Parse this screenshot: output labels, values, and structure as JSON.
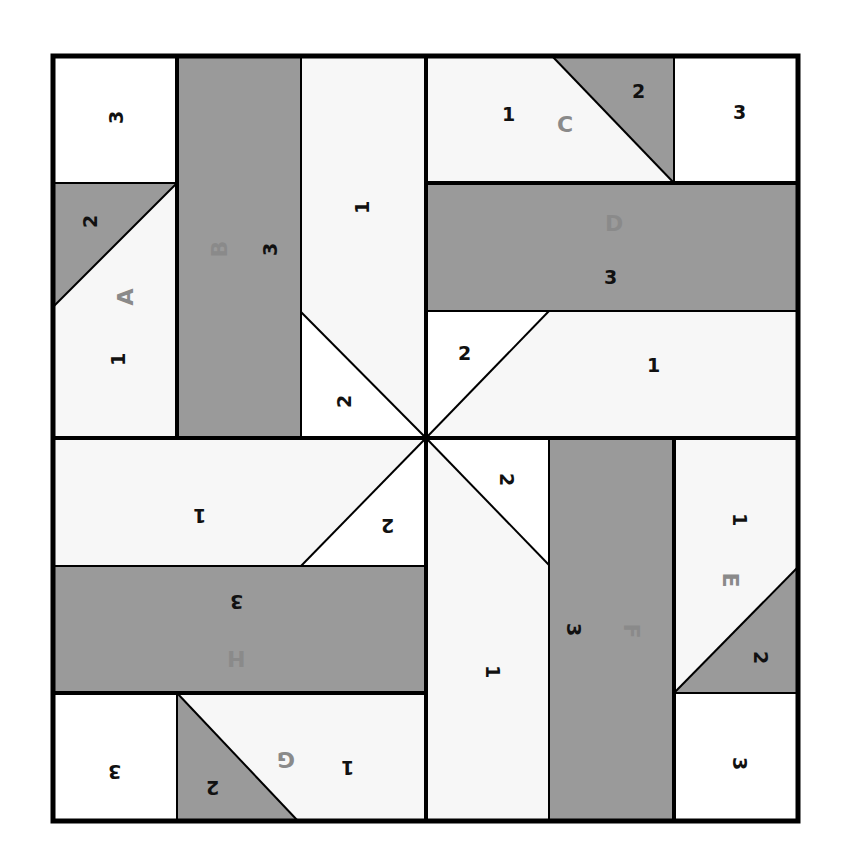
{
  "diagram": {
    "type": "quilt-block-foundation-piecing",
    "colors": {
      "dark": "#9a9a9a",
      "light": "#f7f7f7",
      "white": "#ffffff",
      "line": "#000000",
      "letter": "#8a8a8a",
      "number": "#111111"
    },
    "sections": [
      {
        "letter": "A",
        "pieces": [
          "1",
          "2",
          "3"
        ]
      },
      {
        "letter": "B",
        "pieces": [
          "1",
          "2",
          "3"
        ]
      },
      {
        "letter": "C",
        "pieces": [
          "1",
          "2",
          "3"
        ]
      },
      {
        "letter": "D",
        "pieces": [
          "1",
          "2",
          "3"
        ]
      },
      {
        "letter": "E",
        "pieces": [
          "1",
          "2",
          "3"
        ]
      },
      {
        "letter": "F",
        "pieces": [
          "1",
          "2",
          "3"
        ]
      },
      {
        "letter": "G",
        "pieces": [
          "1",
          "2",
          "3"
        ]
      },
      {
        "letter": "H",
        "pieces": [
          "1",
          "2",
          "3"
        ]
      }
    ],
    "labels": {
      "A": {
        "letter": "A",
        "p1": "1",
        "p2": "2",
        "p3": "3"
      },
      "B": {
        "letter": "B",
        "p1": "1",
        "p2": "2",
        "p3": "3"
      },
      "C": {
        "letter": "C",
        "p1": "1",
        "p2": "2",
        "p3": "3"
      },
      "D": {
        "letter": "D",
        "p1": "1",
        "p2": "2",
        "p3": "3"
      },
      "E": {
        "letter": "E",
        "p1": "1",
        "p2": "2",
        "p3": "3"
      },
      "F": {
        "letter": "F",
        "p1": "1",
        "p2": "2",
        "p3": "3"
      },
      "G": {
        "letter": "G",
        "p1": "1",
        "p2": "2",
        "p3": "3"
      },
      "H": {
        "letter": "H",
        "p1": "1",
        "p2": "2",
        "p3": "3"
      }
    }
  }
}
